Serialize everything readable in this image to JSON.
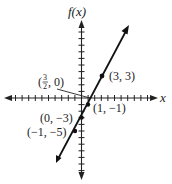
{
  "chart_data": {
    "type": "line",
    "title": "",
    "function": "f(x) = 2x - 3",
    "xlabel": "x",
    "ylabel": "f(x)",
    "grid": false,
    "legend": null,
    "xlim": [
      -11,
      11
    ],
    "ylim": [
      -12,
      12
    ],
    "series": [
      {
        "name": "f(x)",
        "x": [
          -3.5,
          -1,
          0,
          1,
          1.5,
          3,
          7
        ],
        "y": [
          -10,
          -5,
          -3,
          -1,
          0,
          3,
          11
        ]
      }
    ],
    "points": [
      {
        "x": 3,
        "y": 3,
        "label": "(3, 3)",
        "marker": true
      },
      {
        "x": 1.5,
        "y": 0,
        "label": "(3/2, 0)",
        "marker": false
      },
      {
        "x": 1,
        "y": -1,
        "label": "(1, −1)",
        "marker": true
      },
      {
        "x": 0,
        "y": -3,
        "label": "(0, −3)",
        "marker": true
      },
      {
        "x": -1,
        "y": -5,
        "label": "(−1, −5)",
        "marker": true
      }
    ]
  },
  "labels": {
    "y_axis": "f(x)",
    "x_axis": "x",
    "p33": "(3, 3)",
    "p1m1": "(1, −1)",
    "p0m3": "(0, −3)",
    "pm1m5": "(−1, −5)",
    "frac_num": "3",
    "frac_den": "2",
    "frac_rest": ", 0)",
    "frac_open": "("
  }
}
